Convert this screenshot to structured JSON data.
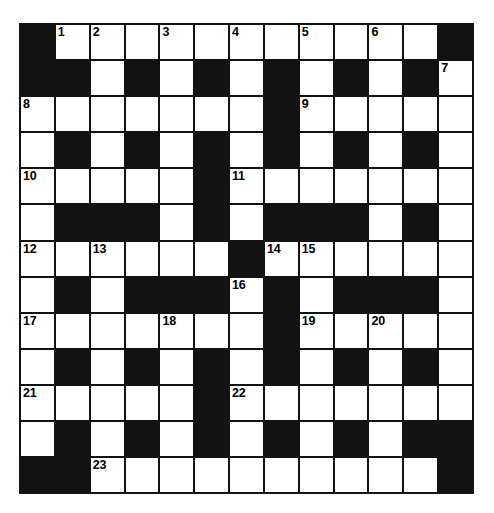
{
  "puzzle": {
    "title": "Crossword Grid",
    "columns": 13,
    "rows": 13,
    "colors": {
      "block": "#121212",
      "cell": "#ffffff",
      "border": "#111111",
      "number_text": "#000000",
      "page_background": "#ffffff"
    },
    "numbers_visible": [
      "1",
      "2",
      "3",
      "4",
      "5",
      "6",
      "7",
      "8",
      "9",
      "10",
      "11",
      "12",
      "13",
      "14",
      "15",
      "16",
      "17",
      "18",
      "19",
      "20",
      "21",
      "22",
      "23"
    ],
    "grid": [
      [
        {
          "type": "block",
          "num": ""
        },
        {
          "type": "cell",
          "num": "1"
        },
        {
          "type": "cell",
          "num": "2"
        },
        {
          "type": "cell",
          "num": ""
        },
        {
          "type": "cell",
          "num": "3"
        },
        {
          "type": "cell",
          "num": ""
        },
        {
          "type": "cell",
          "num": "4"
        },
        {
          "type": "cell",
          "num": ""
        },
        {
          "type": "cell",
          "num": "5"
        },
        {
          "type": "cell",
          "num": ""
        },
        {
          "type": "cell",
          "num": "6"
        },
        {
          "type": "cell",
          "num": ""
        },
        {
          "type": "block",
          "num": ""
        }
      ],
      [
        {
          "type": "block",
          "num": ""
        },
        {
          "type": "block",
          "num": ""
        },
        {
          "type": "cell",
          "num": ""
        },
        {
          "type": "block",
          "num": ""
        },
        {
          "type": "cell",
          "num": ""
        },
        {
          "type": "block",
          "num": ""
        },
        {
          "type": "cell",
          "num": ""
        },
        {
          "type": "block",
          "num": ""
        },
        {
          "type": "cell",
          "num": ""
        },
        {
          "type": "block",
          "num": ""
        },
        {
          "type": "cell",
          "num": ""
        },
        {
          "type": "block",
          "num": ""
        },
        {
          "type": "cell",
          "num": "7"
        }
      ],
      [
        {
          "type": "cell",
          "num": "8"
        },
        {
          "type": "cell",
          "num": ""
        },
        {
          "type": "cell",
          "num": ""
        },
        {
          "type": "cell",
          "num": ""
        },
        {
          "type": "cell",
          "num": ""
        },
        {
          "type": "cell",
          "num": ""
        },
        {
          "type": "cell",
          "num": ""
        },
        {
          "type": "block",
          "num": ""
        },
        {
          "type": "cell",
          "num": "9"
        },
        {
          "type": "cell",
          "num": ""
        },
        {
          "type": "cell",
          "num": ""
        },
        {
          "type": "cell",
          "num": ""
        },
        {
          "type": "cell",
          "num": ""
        }
      ],
      [
        {
          "type": "cell",
          "num": ""
        },
        {
          "type": "block",
          "num": ""
        },
        {
          "type": "cell",
          "num": ""
        },
        {
          "type": "block",
          "num": ""
        },
        {
          "type": "cell",
          "num": ""
        },
        {
          "type": "block",
          "num": ""
        },
        {
          "type": "cell",
          "num": ""
        },
        {
          "type": "block",
          "num": ""
        },
        {
          "type": "cell",
          "num": ""
        },
        {
          "type": "block",
          "num": ""
        },
        {
          "type": "cell",
          "num": ""
        },
        {
          "type": "block",
          "num": ""
        },
        {
          "type": "cell",
          "num": ""
        }
      ],
      [
        {
          "type": "cell",
          "num": "10"
        },
        {
          "type": "cell",
          "num": ""
        },
        {
          "type": "cell",
          "num": ""
        },
        {
          "type": "cell",
          "num": ""
        },
        {
          "type": "cell",
          "num": ""
        },
        {
          "type": "block",
          "num": ""
        },
        {
          "type": "cell",
          "num": "11"
        },
        {
          "type": "cell",
          "num": ""
        },
        {
          "type": "cell",
          "num": ""
        },
        {
          "type": "cell",
          "num": ""
        },
        {
          "type": "cell",
          "num": ""
        },
        {
          "type": "cell",
          "num": ""
        },
        {
          "type": "cell",
          "num": ""
        }
      ],
      [
        {
          "type": "cell",
          "num": ""
        },
        {
          "type": "block",
          "num": ""
        },
        {
          "type": "block",
          "num": ""
        },
        {
          "type": "block",
          "num": ""
        },
        {
          "type": "cell",
          "num": ""
        },
        {
          "type": "block",
          "num": ""
        },
        {
          "type": "cell",
          "num": ""
        },
        {
          "type": "block",
          "num": ""
        },
        {
          "type": "block",
          "num": ""
        },
        {
          "type": "block",
          "num": ""
        },
        {
          "type": "cell",
          "num": ""
        },
        {
          "type": "block",
          "num": ""
        },
        {
          "type": "cell",
          "num": ""
        }
      ],
      [
        {
          "type": "cell",
          "num": "12"
        },
        {
          "type": "cell",
          "num": ""
        },
        {
          "type": "cell",
          "num": "13"
        },
        {
          "type": "cell",
          "num": ""
        },
        {
          "type": "cell",
          "num": ""
        },
        {
          "type": "cell",
          "num": ""
        },
        {
          "type": "block",
          "num": ""
        },
        {
          "type": "cell",
          "num": "14"
        },
        {
          "type": "cell",
          "num": "15"
        },
        {
          "type": "cell",
          "num": ""
        },
        {
          "type": "cell",
          "num": ""
        },
        {
          "type": "cell",
          "num": ""
        },
        {
          "type": "cell",
          "num": ""
        }
      ],
      [
        {
          "type": "cell",
          "num": ""
        },
        {
          "type": "block",
          "num": ""
        },
        {
          "type": "cell",
          "num": ""
        },
        {
          "type": "block",
          "num": ""
        },
        {
          "type": "block",
          "num": ""
        },
        {
          "type": "block",
          "num": ""
        },
        {
          "type": "cell",
          "num": "16"
        },
        {
          "type": "block",
          "num": ""
        },
        {
          "type": "cell",
          "num": ""
        },
        {
          "type": "block",
          "num": ""
        },
        {
          "type": "block",
          "num": ""
        },
        {
          "type": "block",
          "num": ""
        },
        {
          "type": "cell",
          "num": ""
        }
      ],
      [
        {
          "type": "cell",
          "num": "17"
        },
        {
          "type": "cell",
          "num": ""
        },
        {
          "type": "cell",
          "num": ""
        },
        {
          "type": "cell",
          "num": ""
        },
        {
          "type": "cell",
          "num": "18"
        },
        {
          "type": "cell",
          "num": ""
        },
        {
          "type": "cell",
          "num": ""
        },
        {
          "type": "block",
          "num": ""
        },
        {
          "type": "cell",
          "num": "19"
        },
        {
          "type": "cell",
          "num": ""
        },
        {
          "type": "cell",
          "num": "20"
        },
        {
          "type": "cell",
          "num": ""
        },
        {
          "type": "cell",
          "num": ""
        }
      ],
      [
        {
          "type": "cell",
          "num": ""
        },
        {
          "type": "block",
          "num": ""
        },
        {
          "type": "cell",
          "num": ""
        },
        {
          "type": "block",
          "num": ""
        },
        {
          "type": "cell",
          "num": ""
        },
        {
          "type": "block",
          "num": ""
        },
        {
          "type": "cell",
          "num": ""
        },
        {
          "type": "block",
          "num": ""
        },
        {
          "type": "cell",
          "num": ""
        },
        {
          "type": "block",
          "num": ""
        },
        {
          "type": "cell",
          "num": ""
        },
        {
          "type": "block",
          "num": ""
        },
        {
          "type": "cell",
          "num": ""
        }
      ],
      [
        {
          "type": "cell",
          "num": "21"
        },
        {
          "type": "cell",
          "num": ""
        },
        {
          "type": "cell",
          "num": ""
        },
        {
          "type": "cell",
          "num": ""
        },
        {
          "type": "cell",
          "num": ""
        },
        {
          "type": "block",
          "num": ""
        },
        {
          "type": "cell",
          "num": "22"
        },
        {
          "type": "cell",
          "num": ""
        },
        {
          "type": "cell",
          "num": ""
        },
        {
          "type": "cell",
          "num": ""
        },
        {
          "type": "cell",
          "num": ""
        },
        {
          "type": "cell",
          "num": ""
        },
        {
          "type": "cell",
          "num": ""
        }
      ],
      [
        {
          "type": "cell",
          "num": ""
        },
        {
          "type": "block",
          "num": ""
        },
        {
          "type": "cell",
          "num": ""
        },
        {
          "type": "block",
          "num": ""
        },
        {
          "type": "cell",
          "num": ""
        },
        {
          "type": "block",
          "num": ""
        },
        {
          "type": "cell",
          "num": ""
        },
        {
          "type": "block",
          "num": ""
        },
        {
          "type": "cell",
          "num": ""
        },
        {
          "type": "block",
          "num": ""
        },
        {
          "type": "cell",
          "num": ""
        },
        {
          "type": "block",
          "num": ""
        },
        {
          "type": "block",
          "num": ""
        }
      ],
      [
        {
          "type": "block",
          "num": ""
        },
        {
          "type": "block",
          "num": ""
        },
        {
          "type": "cell",
          "num": "23"
        },
        {
          "type": "cell",
          "num": ""
        },
        {
          "type": "cell",
          "num": ""
        },
        {
          "type": "cell",
          "num": ""
        },
        {
          "type": "cell",
          "num": ""
        },
        {
          "type": "cell",
          "num": ""
        },
        {
          "type": "cell",
          "num": ""
        },
        {
          "type": "cell",
          "num": ""
        },
        {
          "type": "cell",
          "num": ""
        },
        {
          "type": "cell",
          "num": ""
        },
        {
          "type": "block",
          "num": ""
        }
      ]
    ]
  }
}
